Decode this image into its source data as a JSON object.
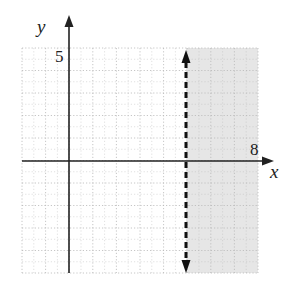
{
  "chart_data": {
    "type": "line",
    "title": "",
    "xlabel": "x",
    "ylabel": "y",
    "xlim": [
      -2,
      8
    ],
    "ylim": [
      -5,
      5
    ],
    "x_tick_labels": [
      {
        "value": 8,
        "label": "8"
      }
    ],
    "y_tick_labels": [
      {
        "value": 5,
        "label": "5"
      }
    ],
    "grid": true,
    "grid_step": 1,
    "boundary": {
      "equation": "x = 5",
      "style": "dashed",
      "x": 5,
      "y_range": [
        -5,
        5
      ],
      "arrows": "both"
    },
    "shaded_region": {
      "inequality": "x > 5",
      "x_range": [
        5,
        8
      ],
      "y_range": [
        -5,
        5
      ],
      "color": "#e6e6e6"
    },
    "series": []
  },
  "labels": {
    "x_axis": "x",
    "y_axis": "y",
    "x_max": "8",
    "y_max": "5"
  },
  "colors": {
    "axis": "#222222",
    "grid": "#b8b8b8",
    "shade": "#e6e6e6",
    "boundary": "#111111"
  }
}
